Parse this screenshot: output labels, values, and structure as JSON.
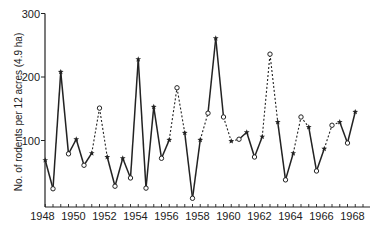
{
  "chart_data": {
    "type": "line",
    "title": "",
    "xlabel": "",
    "ylabel": "No. of rodents per 12 acres (4.9 ha)",
    "xlim": [
      1948,
      1969
    ],
    "ylim": [
      0,
      300
    ],
    "x_ticks": [
      1948,
      1950,
      1952,
      1954,
      1956,
      1958,
      1960,
      1962,
      1964,
      1966,
      1968
    ],
    "x_minor_tick_step": 0.5,
    "y_ticks": [
      100,
      200,
      300
    ],
    "grid": false,
    "legend": null,
    "markers": {
      "*": "spring count (filled star)",
      "o": "autumn count (open circle)"
    },
    "segment_styles": {
      "solid": "solid line",
      "dashed": "dashed line"
    },
    "series": [
      {
        "name": "Rodent density",
        "points": [
          {
            "x": 1948.5,
            "y": 69,
            "marker": "*",
            "next": "solid"
          },
          {
            "x": 1949.0,
            "y": 24,
            "marker": "o",
            "next": "solid"
          },
          {
            "x": 1949.5,
            "y": 208,
            "marker": "*",
            "next": "solid"
          },
          {
            "x": 1950.0,
            "y": 79,
            "marker": "o",
            "next": "solid"
          },
          {
            "x": 1950.5,
            "y": 102,
            "marker": "*",
            "next": "solid"
          },
          {
            "x": 1951.0,
            "y": 61,
            "marker": "o",
            "next": "solid"
          },
          {
            "x": 1951.5,
            "y": 80,
            "marker": "*",
            "next": "dashed"
          },
          {
            "x": 1952.0,
            "y": 151,
            "marker": "o",
            "next": "dashed"
          },
          {
            "x": 1952.5,
            "y": 74,
            "marker": "*",
            "next": "solid"
          },
          {
            "x": 1953.0,
            "y": 28,
            "marker": "o",
            "next": "solid"
          },
          {
            "x": 1953.5,
            "y": 72,
            "marker": "*",
            "next": "solid"
          },
          {
            "x": 1954.0,
            "y": 41,
            "marker": "o",
            "next": "solid"
          },
          {
            "x": 1954.5,
            "y": 228,
            "marker": "*",
            "next": "solid"
          },
          {
            "x": 1955.0,
            "y": 25,
            "marker": "o",
            "next": "solid"
          },
          {
            "x": 1955.5,
            "y": 153,
            "marker": "*",
            "next": "solid"
          },
          {
            "x": 1956.0,
            "y": 72,
            "marker": "o",
            "next": "solid"
          },
          {
            "x": 1956.5,
            "y": 101,
            "marker": "*",
            "next": "dashed"
          },
          {
            "x": 1957.0,
            "y": 183,
            "marker": "o",
            "next": "dashed"
          },
          {
            "x": 1957.5,
            "y": 112,
            "marker": "*",
            "next": "solid"
          },
          {
            "x": 1958.0,
            "y": 9,
            "marker": "o",
            "next": "solid"
          },
          {
            "x": 1958.5,
            "y": 101,
            "marker": "*",
            "next": "dashed"
          },
          {
            "x": 1959.0,
            "y": 143,
            "marker": "o",
            "next": "solid"
          },
          {
            "x": 1959.5,
            "y": 261,
            "marker": "*",
            "next": "solid"
          },
          {
            "x": 1960.0,
            "y": 137,
            "marker": "o",
            "next": "dashed"
          },
          {
            "x": 1960.5,
            "y": 99,
            "marker": "*",
            "next": "dashed"
          },
          {
            "x": 1961.0,
            "y": 102,
            "marker": "o",
            "next": "solid"
          },
          {
            "x": 1961.5,
            "y": 113,
            "marker": "*",
            "next": "solid"
          },
          {
            "x": 1962.0,
            "y": 74,
            "marker": "o",
            "next": "solid"
          },
          {
            "x": 1962.5,
            "y": 106,
            "marker": "*",
            "next": "dashed"
          },
          {
            "x": 1963.0,
            "y": 236,
            "marker": "o",
            "next": "dashed"
          },
          {
            "x": 1963.5,
            "y": 129,
            "marker": "*",
            "next": "solid"
          },
          {
            "x": 1964.0,
            "y": 38,
            "marker": "o",
            "next": "solid"
          },
          {
            "x": 1964.5,
            "y": 80,
            "marker": "*",
            "next": "dashed"
          },
          {
            "x": 1965.0,
            "y": 137,
            "marker": "o",
            "next": "dashed"
          },
          {
            "x": 1965.5,
            "y": 121,
            "marker": "*",
            "next": "solid"
          },
          {
            "x": 1966.0,
            "y": 52,
            "marker": "o",
            "next": "solid"
          },
          {
            "x": 1966.5,
            "y": 87,
            "marker": "*",
            "next": "dashed"
          },
          {
            "x": 1967.0,
            "y": 124,
            "marker": "o",
            "next": "dashed"
          },
          {
            "x": 1967.5,
            "y": 129,
            "marker": "*",
            "next": "solid"
          },
          {
            "x": 1968.0,
            "y": 96,
            "marker": "o",
            "next": "solid"
          },
          {
            "x": 1968.5,
            "y": 145,
            "marker": "*",
            "next": null
          }
        ]
      }
    ]
  },
  "style": {
    "ink": "#222222",
    "background": "#ffffff"
  }
}
